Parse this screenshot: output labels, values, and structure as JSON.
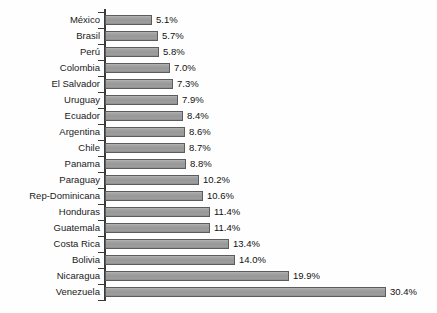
{
  "chart_data": {
    "type": "bar",
    "orientation": "horizontal",
    "title": "",
    "subtitle": "",
    "xlabel": "",
    "ylabel": "",
    "grid": false,
    "legend": null,
    "axis": {
      "value_axis_visible": false,
      "category_axis_visible": true,
      "value_suffix": "%"
    },
    "xlim": [
      0,
      30.4
    ],
    "categories": [
      "México",
      "Brasil",
      "Perú",
      "Colombia",
      "El Salvador",
      "Uruguay",
      "Ecuador",
      "Argentina",
      "Chile",
      "Panama",
      "Paraguay",
      "Rep-Dominicana",
      "Honduras",
      "Guatemala",
      "Costa Rica",
      "Bolivia",
      "Nicaragua",
      "Venezuela"
    ],
    "values": [
      5.1,
      5.7,
      5.8,
      7.0,
      7.3,
      7.9,
      8.4,
      8.6,
      8.7,
      8.8,
      10.2,
      10.6,
      11.4,
      11.4,
      13.4,
      14.0,
      19.9,
      30.4
    ],
    "data_labels": [
      "5.1%",
      "5.7%",
      "5.8%",
      "7.0%",
      "7.3%",
      "7.9%",
      "8.4%",
      "8.6%",
      "8.7%",
      "8.8%",
      "10.2%",
      "10.6%",
      "11.4%",
      "11.4%",
      "13.4%",
      "14.0%",
      "19.9%",
      "30.4%"
    ],
    "colors": {
      "bar_fill": "#9a9a9a",
      "bar_border": "#5c5c5c",
      "axis": "#3a3a3a",
      "text": "#1a1a1a",
      "background": "#fefefe"
    }
  },
  "geometry": {
    "axis_x": 105,
    "first_bar_top": 12,
    "row_pitch": 16,
    "bar_height": 10,
    "px_per_percent": 9.25
  }
}
